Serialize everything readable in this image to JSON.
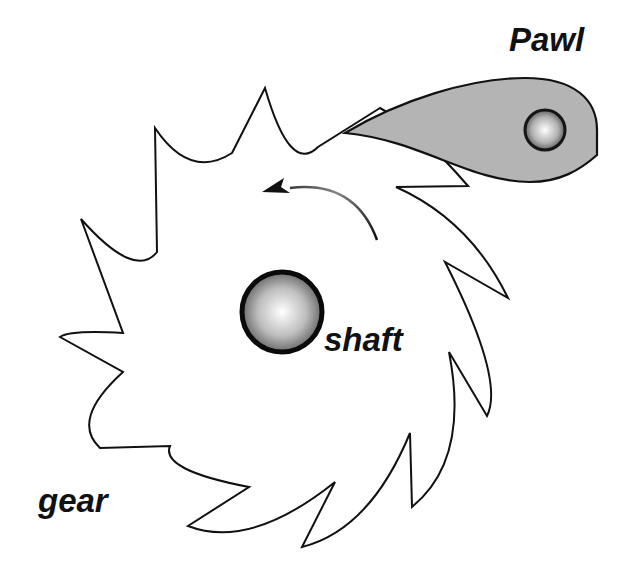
{
  "figure": {
    "labels": {
      "pawl": "Pawl",
      "shaft": "shaft",
      "gear": "gear"
    },
    "rotation_direction": "counter-clockwise",
    "colors": {
      "background": "#ffffff",
      "outline": "#111111",
      "pawl_fill": "#b4b4b4",
      "sphere_light": "#ffffff",
      "sphere_dark": "#555555",
      "shaft_rim": "#0a0a0a"
    }
  }
}
